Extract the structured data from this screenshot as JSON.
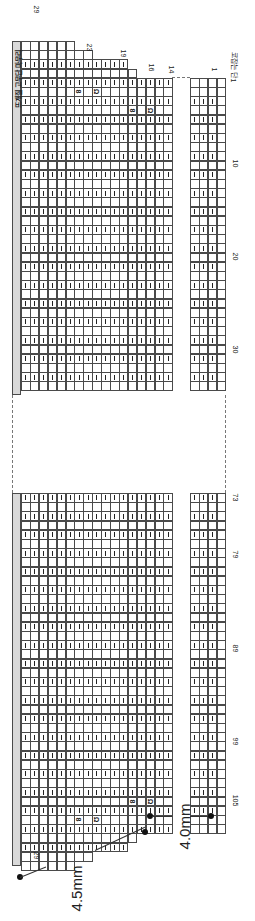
{
  "chart": {
    "title_band": "뜨개질 고무단 마무리",
    "orientation": "rotated-90",
    "cell_w": 8.9,
    "cell_h": 9.2,
    "grid_left": 21,
    "right_section_left": 190,
    "columns_main": 17,
    "columns_right": 4,
    "top_section": {
      "y_start": 41,
      "y_end": 395
    },
    "bottom_section": {
      "y_start": 493,
      "y_end": 866
    },
    "column_top_offsets_rows": [
      0,
      0,
      0,
      0,
      0,
      0,
      1,
      1,
      2,
      2,
      2,
      2,
      3,
      4,
      4,
      4,
      4
    ],
    "right_top_offset_rows": 4,
    "top_labels": [
      {
        "text": "29",
        "x": 33,
        "y": 6
      },
      {
        "text": "23",
        "x": 86,
        "y": 44
      },
      {
        "text": "19",
        "x": 120,
        "y": 50
      },
      {
        "text": "16",
        "x": 148,
        "y": 64
      },
      {
        "text": "14",
        "x": 168,
        "y": 66
      },
      {
        "text": "1",
        "x": 213,
        "y": 66
      },
      {
        "text": "코잡는 단",
        "x": 222,
        "y": 60
      },
      {
        "text": "1",
        "x": 232,
        "y": 77
      }
    ],
    "row_labels_top": [
      {
        "text": "10",
        "x": 232,
        "y": 160
      },
      {
        "text": "20",
        "x": 232,
        "y": 253
      },
      {
        "text": "30",
        "x": 232,
        "y": 346
      }
    ],
    "row_labels_bottom": [
      {
        "text": "73",
        "x": 232,
        "y": 494
      },
      {
        "text": "79",
        "x": 232,
        "y": 551
      },
      {
        "text": "89",
        "x": 232,
        "y": 645
      },
      {
        "text": "99",
        "x": 232,
        "y": 738
      },
      {
        "text": "105",
        "x": 230,
        "y": 797
      }
    ],
    "bottom_labels": [
      {
        "text": "29",
        "x": 33,
        "y": 852
      }
    ],
    "symbols": {
      "purl": "|",
      "yo_left": "8",
      "yo_right": "Ω"
    },
    "special_top": [
      {
        "col": 7,
        "row": 5,
        "sym": "yo_left"
      },
      {
        "col": 9,
        "row": 5,
        "sym": "yo_right"
      },
      {
        "col": 13,
        "row": 7,
        "sym": "yo_left"
      },
      {
        "col": 15,
        "row": 7,
        "sym": "yo_right"
      }
    ],
    "needle_sizes": [
      {
        "label": "4.5mm",
        "x": 30,
        "y": 880
      },
      {
        "label": "4.0mm",
        "x": 158,
        "y": 826
      }
    ]
  }
}
